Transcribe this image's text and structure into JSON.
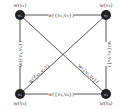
{
  "nodes": [
    {
      "id": "v1",
      "inner": "v₁",
      "weight": "w(v₁)"
    },
    {
      "id": "v2",
      "inner": "v₂",
      "weight": "w(v₂)"
    },
    {
      "id": "v3",
      "inner": "v₃",
      "weight": "w(v₃)"
    },
    {
      "id": "v4",
      "inner": "v₄",
      "weight": "w(v₄)"
    }
  ],
  "edges": [
    {
      "id": "v1v2",
      "label": "w({v₁,v₂})"
    },
    {
      "id": "v1v3",
      "label": "w({v₁,v₃})"
    },
    {
      "id": "v2v4",
      "label": "w({v₂,v₄})"
    },
    {
      "id": "v3v4",
      "label": "w({v₃,v₄})"
    },
    {
      "id": "v2v3",
      "label": "w({v₂,v₃})"
    },
    {
      "id": "v1v4",
      "label": "w({v₁,v₄})"
    }
  ]
}
